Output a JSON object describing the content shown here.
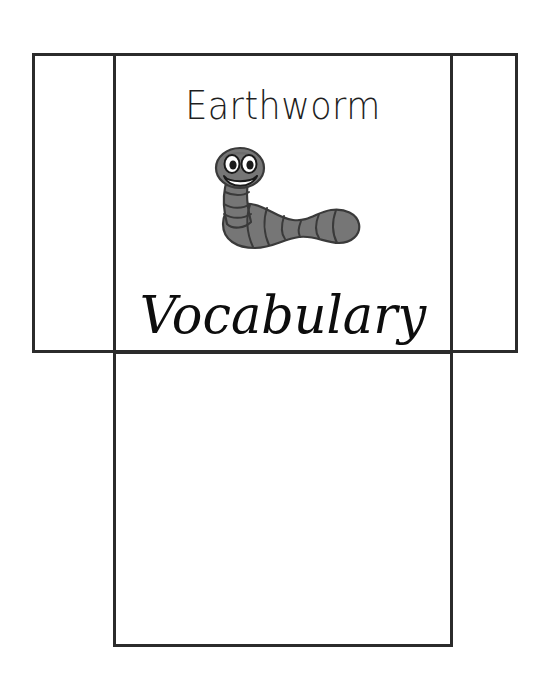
{
  "document": {
    "type": "foldable-vocabulary-template",
    "title_line_1": "Earthworm",
    "title_line_2": "Vocabulary",
    "background_color": "#ffffff",
    "line_color": "#2b2b2b"
  },
  "panels": {
    "left_flap": {
      "name": "left-flap",
      "label": ""
    },
    "right_flap": {
      "name": "right-flap",
      "label": ""
    },
    "cover": {
      "name": "cover-panel",
      "label": ""
    },
    "bottom": {
      "name": "bottom-panel",
      "label": ""
    }
  },
  "illustration": {
    "name": "earthworm-icon",
    "description": "smiling cartoon earthworm",
    "body_color": "#767676",
    "body_shade_color": "#646464",
    "outline_color": "#3a3a3a",
    "eye_white_color": "#ffffff",
    "pupil_color": "#1a1a1a",
    "mouth_color": "#ffffff"
  }
}
